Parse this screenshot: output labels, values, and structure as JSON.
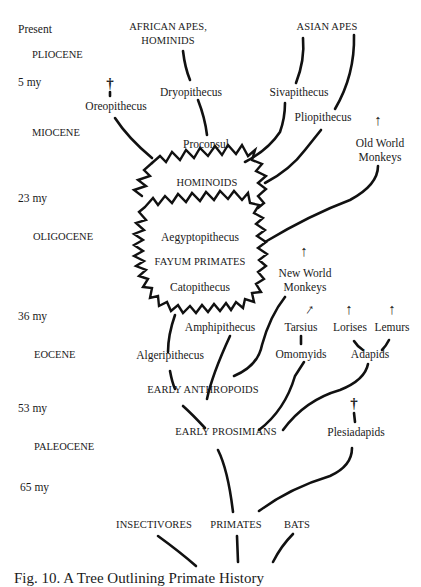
{
  "diagram": {
    "type": "phylogenetic-tree",
    "caption": "Fig. 10. A Tree Outlining Primate History"
  },
  "timescale": {
    "times": [
      {
        "id": "present",
        "label": "Present"
      },
      {
        "id": "5my",
        "label": "5 my"
      },
      {
        "id": "23my",
        "label": "23 my"
      },
      {
        "id": "36my",
        "label": "36 my"
      },
      {
        "id": "53my",
        "label": "53 my"
      },
      {
        "id": "65my",
        "label": "65 my"
      }
    ],
    "epochs": [
      {
        "id": "pliocene",
        "label": "PLIOCENE"
      },
      {
        "id": "miocene",
        "label": "MIOCENE"
      },
      {
        "id": "oligocene",
        "label": "OLIGOCENE"
      },
      {
        "id": "eocene",
        "label": "EOCENE"
      },
      {
        "id": "paleocene",
        "label": "PALEOCENE"
      }
    ]
  },
  "nodes": {
    "african_apes": {
      "line1": "AFRICAN APES,",
      "line2": "HOMINIDS"
    },
    "asian_apes": {
      "label": "ASIAN APES"
    },
    "oreopithecus": {
      "label": "Oreopithecus",
      "extinct": true
    },
    "dryopithecus": {
      "label": "Dryopithecus"
    },
    "sivapithecus": {
      "label": "Sivapithecus"
    },
    "pliopithecus": {
      "label": "Pliopithecus"
    },
    "proconsul": {
      "label": "Proconsul"
    },
    "old_world_monkeys": {
      "line1": "Old World",
      "line2": "Monkeys",
      "continues_to_present": true
    },
    "hominoids": {
      "label": "HOMINOIDS"
    },
    "aegyptopithecus": {
      "label": "Aegyptopithecus"
    },
    "fayum_primates": {
      "label": "FAYUM PRIMATES"
    },
    "catopithecus": {
      "label": "Catopithecus"
    },
    "new_world_monkeys": {
      "line1": "New World",
      "line2": "Monkeys",
      "continues_to_present": true
    },
    "amphipithecus": {
      "label": "Amphipithecus"
    },
    "tarsius": {
      "label": "Tarsius",
      "continues_to_present": true
    },
    "lorises": {
      "label": "Lorises",
      "continues_to_present": true
    },
    "lemurs": {
      "label": "Lemurs",
      "continues_to_present": true
    },
    "algeripithecus": {
      "label": "Algeripithecus"
    },
    "omomyids": {
      "label": "Omomyids"
    },
    "adapids": {
      "label": "Adapids"
    },
    "early_anthropoids": {
      "label": "EARLY ANTHROPOIDS"
    },
    "early_prosimians": {
      "label": "EARLY PROSIMIANS"
    },
    "plesiadapids": {
      "label": "Plesiadapids",
      "extinct": true
    },
    "insectivores": {
      "label": "INSECTIVORES"
    },
    "primates": {
      "label": "PRIMATES"
    },
    "bats": {
      "label": "BATS"
    }
  },
  "symbols": {
    "extinct": "†",
    "continues": "↑"
  }
}
